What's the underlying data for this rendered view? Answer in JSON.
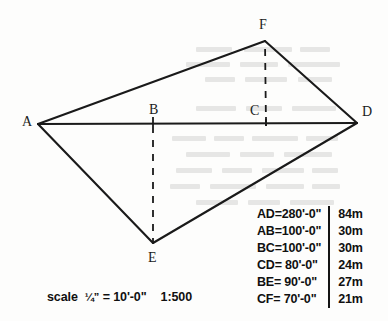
{
  "figure": {
    "kind": "surveying-triangulation-sketch",
    "vertices": [
      {
        "id": "A",
        "label": "A",
        "x": 38,
        "y": 124,
        "label_x": 22,
        "label_y": 115
      },
      {
        "id": "B",
        "label": "B",
        "x": 153,
        "y": 126,
        "label_x": 149,
        "label_y": 103
      },
      {
        "id": "C",
        "label": "C",
        "x": 266,
        "y": 126,
        "label_x": 250,
        "label_y": 104
      },
      {
        "id": "D",
        "label": "D",
        "x": 357,
        "y": 123,
        "label_x": 362,
        "label_y": 105
      },
      {
        "id": "E",
        "label": "E",
        "x": 153,
        "y": 243,
        "label_x": 148,
        "label_y": 251
      },
      {
        "id": "F",
        "label": "F",
        "x": 265,
        "y": 41,
        "label_x": 259,
        "label_y": 18
      }
    ],
    "solid_edges": [
      [
        "A",
        "F"
      ],
      [
        "F",
        "D"
      ],
      [
        "A",
        "D"
      ],
      [
        "A",
        "E"
      ],
      [
        "E",
        "D"
      ]
    ],
    "dashed_edges": [
      [
        "B",
        "E"
      ],
      [
        "C",
        "F"
      ]
    ],
    "baseline": "AD",
    "stroke_color": "#1a1a1a"
  },
  "dimension_table": {
    "rows": [
      {
        "line": "AD=280'-0\"",
        "metric": "84m"
      },
      {
        "line": "AB=100'-0\"",
        "metric": "30m"
      },
      {
        "line": "BC=100'-0\"",
        "metric": "30m"
      },
      {
        "line": "CD= 80'-0\"",
        "metric": "24m"
      },
      {
        "line": "BE= 90'-0\"",
        "metric": "27m"
      },
      {
        "line": "CF= 70'-0\"",
        "metric": "21m"
      }
    ]
  },
  "scale_note": {
    "prefix": "scale",
    "fraction": "¼”",
    "equals": "=",
    "imperial": "10'-0\"",
    "ratio": "1:500"
  },
  "ghost_text_bars": [
    {
      "x": 196,
      "y": 47,
      "w": 36,
      "h": 5
    },
    {
      "x": 244,
      "y": 47,
      "w": 48,
      "h": 5
    },
    {
      "x": 300,
      "y": 47,
      "w": 30,
      "h": 5
    },
    {
      "x": 186,
      "y": 62,
      "w": 44,
      "h": 5
    },
    {
      "x": 240,
      "y": 62,
      "w": 38,
      "h": 5
    },
    {
      "x": 288,
      "y": 62,
      "w": 52,
      "h": 5
    },
    {
      "x": 205,
      "y": 77,
      "w": 30,
      "h": 5
    },
    {
      "x": 245,
      "y": 77,
      "w": 42,
      "h": 5
    },
    {
      "x": 298,
      "y": 77,
      "w": 34,
      "h": 5
    },
    {
      "x": 196,
      "y": 106,
      "w": 40,
      "h": 5
    },
    {
      "x": 246,
      "y": 106,
      "w": 36,
      "h": 5
    },
    {
      "x": 292,
      "y": 106,
      "w": 44,
      "h": 5
    },
    {
      "x": 172,
      "y": 136,
      "w": 34,
      "h": 5
    },
    {
      "x": 214,
      "y": 136,
      "w": 30,
      "h": 5
    },
    {
      "x": 252,
      "y": 136,
      "w": 46,
      "h": 5
    },
    {
      "x": 306,
      "y": 136,
      "w": 32,
      "h": 5
    },
    {
      "x": 186,
      "y": 152,
      "w": 44,
      "h": 5
    },
    {
      "x": 240,
      "y": 152,
      "w": 34,
      "h": 5
    },
    {
      "x": 284,
      "y": 152,
      "w": 48,
      "h": 5
    },
    {
      "x": 176,
      "y": 168,
      "w": 36,
      "h": 5
    },
    {
      "x": 222,
      "y": 168,
      "w": 30,
      "h": 5
    },
    {
      "x": 262,
      "y": 168,
      "w": 42,
      "h": 5
    },
    {
      "x": 312,
      "y": 168,
      "w": 26,
      "h": 5
    },
    {
      "x": 170,
      "y": 184,
      "w": 30,
      "h": 5
    },
    {
      "x": 210,
      "y": 184,
      "w": 46,
      "h": 5
    },
    {
      "x": 266,
      "y": 184,
      "w": 38,
      "h": 5
    },
    {
      "x": 312,
      "y": 184,
      "w": 28,
      "h": 5
    },
    {
      "x": 196,
      "y": 200,
      "w": 42,
      "h": 5
    },
    {
      "x": 248,
      "y": 200,
      "w": 32,
      "h": 5
    },
    {
      "x": 290,
      "y": 200,
      "w": 44,
      "h": 5
    }
  ]
}
